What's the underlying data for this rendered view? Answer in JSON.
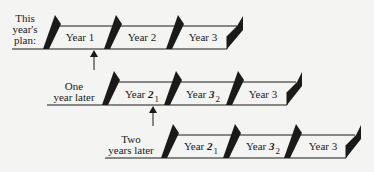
{
  "colors": {
    "background": "#f4f4f2",
    "ink": "#1a1a1a"
  },
  "rows": [
    {
      "label_lines": [
        "This",
        "year's",
        "plan:"
      ],
      "cells": [
        {
          "label": "Year 1",
          "struck": "",
          "replacement": ""
        },
        {
          "label": "Year 2",
          "struck": "",
          "replacement": ""
        },
        {
          "label": "Year 3",
          "struck": "",
          "replacement": ""
        }
      ]
    },
    {
      "label_lines": [
        "One",
        "year later"
      ],
      "cells": [
        {
          "label": "Year ",
          "struck": "2",
          "replacement": "1"
        },
        {
          "label": "Year ",
          "struck": "3",
          "replacement": "2"
        },
        {
          "label": "Year 3",
          "struck": "",
          "replacement": ""
        }
      ]
    },
    {
      "label_lines": [
        "Two",
        "years later"
      ],
      "cells": [
        {
          "label": "Year ",
          "struck": "2",
          "replacement": "1"
        },
        {
          "label": "Year ",
          "struck": "3",
          "replacement": "2"
        },
        {
          "label": "Year 3",
          "struck": "",
          "replacement": ""
        }
      ]
    }
  ],
  "arrows": [
    {
      "from_row": 1,
      "to_row": 0,
      "meaning": "one-year shift"
    },
    {
      "from_row": 2,
      "to_row": 1,
      "meaning": "one-year shift"
    }
  ]
}
